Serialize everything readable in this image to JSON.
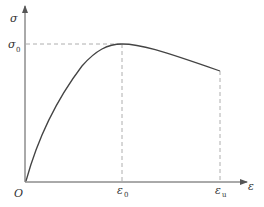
{
  "diagram": {
    "type": "stress-strain curve",
    "axes": {
      "y_label": "σ",
      "x_label": "ε",
      "origin_label": "O"
    },
    "markers": {
      "peak_stress": {
        "symbol": "σ",
        "subscript": "0"
      },
      "peak_strain": {
        "symbol": "ε",
        "subscript": "0"
      },
      "ultimate_strain": {
        "symbol": "ε",
        "subscript": "u"
      }
    },
    "colors": {
      "curve": "#444444",
      "axis": "#555555",
      "dashed": "#999999"
    }
  }
}
